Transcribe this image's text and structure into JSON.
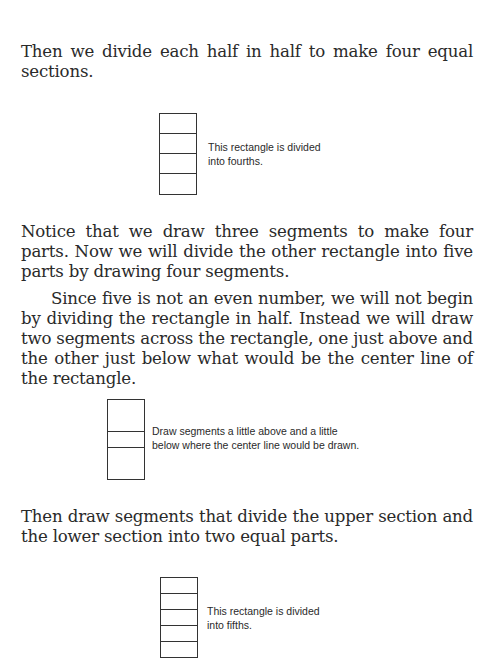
{
  "paragraphs": {
    "p1": "Then we divide each half in half to make four equal sections.",
    "p2": "Notice that we draw three segments to make four parts. Now we will divide the other rectangle into five parts by drawing four segments.",
    "p3": "Since five is not an even number, we will not begin by dividing the rectangle in half. Instead we will draw two segments across the rectangle, one just above and the other just below what would be the center line of the rectangle.",
    "p4": "Then draw segments that divide the upper section and the lower section into two equal parts."
  },
  "figures": {
    "fourths": {
      "caption_line1": "This rectangle is divided",
      "caption_line2": "into fourths.",
      "parts": 4
    },
    "center": {
      "caption_line1": "Draw segments a little above and a little",
      "caption_line2": "below where the center line would be drawn.",
      "parts": 3
    },
    "fifths": {
      "caption_line1": "This rectangle is divided",
      "caption_line2": "into fifths.",
      "parts": 5
    }
  }
}
